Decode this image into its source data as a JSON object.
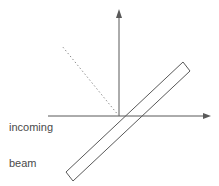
{
  "figure": {
    "background_color": "#ffffff",
    "stroke_color": "#595959",
    "text_color": "#4a4a4a",
    "width": 219,
    "height": 186
  },
  "labels": {
    "beam": {
      "line1": "incoming",
      "line2": "beam"
    }
  },
  "elements": {
    "horizontal_arrow": {
      "name": "incoming-beam-arrow",
      "x1": 48,
      "y1": 116,
      "x2": 211,
      "y2": 116,
      "arrowhead": "right"
    },
    "vertical_arrow": {
      "name": "normal-arrow",
      "x1": 119,
      "y1": 116,
      "x2": 119,
      "y2": 10,
      "arrowhead": "up"
    },
    "dashed_ray": {
      "name": "reflected-ray",
      "x1": 119,
      "y1": 116,
      "x2": 62,
      "y2": 46,
      "dash": "1.5 2.5"
    },
    "slab": {
      "name": "tilted-slab",
      "points": "183,62 190,71 73,181 66,172",
      "angle_deg": -43
    }
  }
}
